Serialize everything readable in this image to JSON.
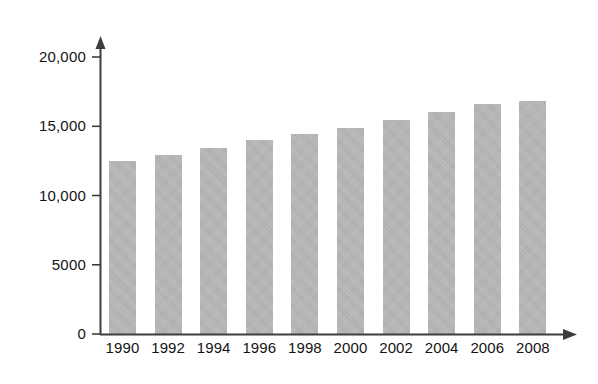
{
  "chart_data": {
    "type": "bar",
    "title": "",
    "subtitle": "",
    "xlabel": "",
    "ylabel": "",
    "categories": [
      "1990",
      "1992",
      "1994",
      "1996",
      "1998",
      "2000",
      "2002",
      "2004",
      "2006",
      "2008"
    ],
    "values": [
      12500,
      12900,
      13400,
      14000,
      14450,
      14900,
      15450,
      16050,
      16600,
      16850
    ],
    "series": [
      {
        "name": "",
        "values": [
          12500,
          12900,
          13400,
          14000,
          14450,
          14900,
          15450,
          16050,
          16600,
          16850
        ]
      }
    ],
    "ylim": [
      0,
      20000
    ],
    "ytick_values": [
      0,
      5000,
      10000,
      15000,
      20000
    ],
    "ytick_labels": [
      "0",
      "5000",
      "10,000",
      "15,000",
      "20,000"
    ],
    "xtick_labels": [
      "1990",
      "1992",
      "1994",
      "1996",
      "1998",
      "2000",
      "2002",
      "2004",
      "2006",
      "2008"
    ],
    "grid": false,
    "legend": [],
    "legend_position": "none",
    "annotations": [],
    "bar_color": "#b3b3b3",
    "axis_color": "#3d3d3d",
    "text_color": "#141414",
    "background_color": "#ffffff",
    "axis_style": "arrow-tipped open axes"
  },
  "axis": {
    "y_axis_name": "value-axis",
    "x_axis_name": "year-axis",
    "y_arrow": "arrow-up-icon",
    "x_arrow": "arrow-right-icon"
  }
}
